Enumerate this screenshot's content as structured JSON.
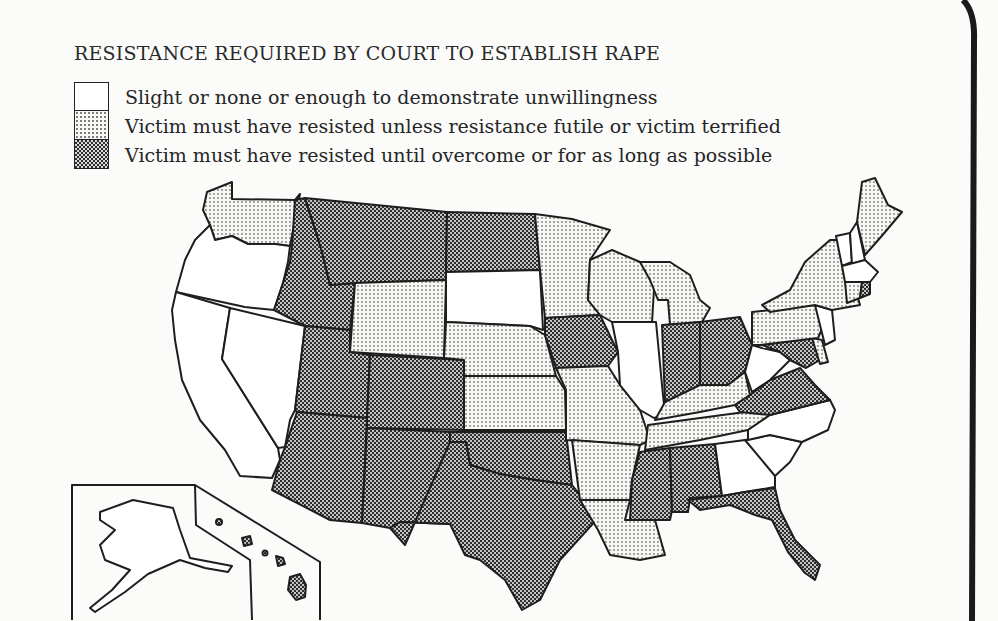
{
  "title": "RESISTANCE REQUIRED BY COURT TO ESTABLISH RAPE",
  "legend": [
    {
      "key": "slight",
      "pattern": "white",
      "label": "Slight or none or enough to demonstrate unwillingness"
    },
    {
      "key": "futile",
      "pattern": "light-stipple",
      "label": "Victim must have resisted unless resistance futile or victim terrified"
    },
    {
      "key": "overcome",
      "pattern": "dark-checker",
      "label": "Victim must have resisted until overcome or for as long as possible"
    }
  ],
  "colors": {
    "white": "#ffffff",
    "light_dot": "#7d7d7d",
    "dark_dot": "#2e2e2e",
    "outline": "#1e1e1e",
    "paper": "#fbfbfa"
  },
  "map": {
    "states": {
      "WA": "futile",
      "OR": "slight",
      "CA": "slight",
      "NV": "slight",
      "ID": "overcome",
      "MT": "overcome",
      "WY": "futile",
      "UT": "overcome",
      "CO": "overcome",
      "AZ": "overcome",
      "NM": "overcome",
      "ND": "overcome",
      "SD": "slight",
      "NE": "futile",
      "KS": "futile",
      "OK": "overcome",
      "TX": "overcome",
      "MN": "futile",
      "IA": "overcome",
      "MO": "futile",
      "AR": "futile",
      "LA": "futile",
      "WI": "futile",
      "IL": "slight",
      "MI": "futile",
      "IN": "overcome",
      "OH": "overcome",
      "KY": "futile",
      "TN": "futile",
      "MS": "overcome",
      "AL": "overcome",
      "GA": "slight",
      "FL": "overcome",
      "SC": "slight",
      "NC": "slight",
      "VA": "overcome",
      "WV": "slight",
      "MD": "overcome",
      "DE": "futile",
      "PA": "futile",
      "NJ": "slight",
      "NY": "futile",
      "CT": "futile",
      "RI": "overcome",
      "MA": "slight",
      "VT": "slight",
      "NH": "slight",
      "ME": "futile",
      "AK": "slight",
      "HI": "overcome"
    }
  }
}
